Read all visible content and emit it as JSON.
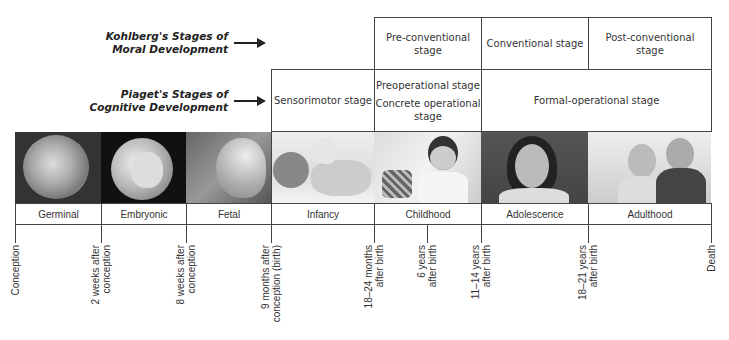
{
  "row_labels": {
    "kohlberg": {
      "line1": "Kohlberg's Stages of",
      "line2": "Moral Development"
    },
    "piaget": {
      "line1": "Piaget's Stages of",
      "line2": "Cognitive Development"
    }
  },
  "kohlberg_stages": [
    {
      "line1": "Pre-conventional",
      "line2": "stage"
    },
    {
      "line1": "Conventional stage",
      "line2": ""
    },
    {
      "line1": "Post-conventional",
      "line2": "stage"
    }
  ],
  "piaget_stages": [
    {
      "line1": "Sensorimotor stage"
    },
    {
      "line1": "Preoperational stage",
      "line2": "Concrete operational",
      "line3": "stage"
    },
    {
      "line1": "Formal-operational stage"
    }
  ],
  "life_stages": [
    {
      "label": "Germinal",
      "photo": "zygote-photo"
    },
    {
      "label": "Embryonic",
      "photo": "embryo-photo"
    },
    {
      "label": "Fetal",
      "photo": "fetus-photo"
    },
    {
      "label": "Infancy",
      "photo": "infant-photo"
    },
    {
      "label": "Childhood",
      "photo": "child-photo"
    },
    {
      "label": "Adolescence",
      "photo": "adolescent-photo"
    },
    {
      "label": "Adulthood",
      "photo": "adults-photo"
    }
  ],
  "timeline_markers": [
    {
      "line1": "Conception",
      "line2": ""
    },
    {
      "line1": "2 weeks after",
      "line2": "conception"
    },
    {
      "line1": "8 weeks after",
      "line2": "conception"
    },
    {
      "line1": "9 months after",
      "line2": "conception (birth)"
    },
    {
      "line1": "18–24 months",
      "line2": "after birth"
    },
    {
      "line1": "6 years",
      "line2": "after birth"
    },
    {
      "line1": "11–14 years",
      "line2": "after birth"
    },
    {
      "line1": "18–21 years",
      "line2": "after birth"
    },
    {
      "line1": "Death",
      "line2": ""
    }
  ],
  "colors": {
    "border": "#444444",
    "text": "#333333",
    "arrow": "#222222"
  }
}
